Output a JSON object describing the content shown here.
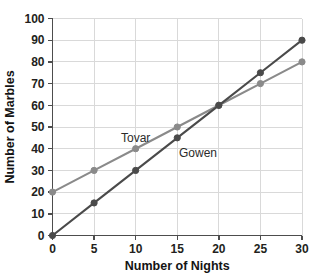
{
  "chart_data": {
    "type": "line",
    "title": "",
    "xlabel": "Number of Nights",
    "ylabel": "Number of Marbles",
    "x": [
      0,
      5,
      10,
      15,
      20,
      25,
      30
    ],
    "xlim": [
      0,
      30
    ],
    "ylim": [
      0,
      100
    ],
    "xticks": [
      "0",
      "5",
      "10",
      "15",
      "20",
      "25",
      "30"
    ],
    "yticks": [
      "0",
      "10",
      "20",
      "30",
      "40",
      "50",
      "60",
      "70",
      "80",
      "90",
      "100"
    ],
    "grid": true,
    "legend_position": "inline-labels",
    "series": [
      {
        "name": "Tovar",
        "values": [
          20,
          30,
          40,
          50,
          60,
          70,
          80
        ],
        "color": "#8a8a8a",
        "label_x": 10,
        "label_y": 43
      },
      {
        "name": "Gowen",
        "values": [
          0,
          15,
          30,
          45,
          60,
          75,
          90
        ],
        "color": "#4a4a4a",
        "label_x": 17.5,
        "label_y": 36
      }
    ],
    "annotations": []
  },
  "colors": {
    "background": "#ffffff",
    "gridline": "#d9d9d9",
    "axis": "#4d4d4d",
    "text": "#231f20"
  }
}
